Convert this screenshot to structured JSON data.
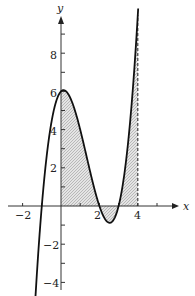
{
  "chart_data": {
    "type": "line",
    "title": "",
    "function": "f(x) = (x+1)(x-2)(x-3)",
    "xlabel": "x",
    "ylabel": "y",
    "xlim": [
      -2.8,
      5.5
    ],
    "ylim": [
      -4.3,
      10.5
    ],
    "x_ticks": [
      -2,
      -1,
      1,
      2,
      3,
      4,
      5
    ],
    "x_tick_labels": [
      "-2",
      "2",
      "4"
    ],
    "y_ticks": [
      -4,
      -3,
      -2,
      -1,
      1,
      2,
      3,
      4,
      5,
      6,
      7,
      8,
      9
    ],
    "y_tick_labels": [
      "-4",
      "-2",
      "2",
      "4",
      "6",
      "8"
    ],
    "grid": false,
    "series": [
      {
        "name": "curve",
        "x": [
          -1.3,
          -1,
          0,
          0.5,
          1,
          2,
          2.5,
          3,
          3.5,
          4
        ],
        "y": [
          -4.14,
          0,
          6,
          5.63,
          4,
          0,
          -0.88,
          0,
          1.88,
          10
        ]
      }
    ],
    "shaded_region": {
      "x_from": 0,
      "x_to": 4,
      "between": "curve and x-axis"
    },
    "annotations": [
      {
        "type": "dashed-vertical-line",
        "x": 4,
        "y_from": 0,
        "y_to": 10
      }
    ],
    "labels": {
      "x_axis": "x",
      "y_axis": "y",
      "xt_neg2": "−2",
      "xt_2": "2",
      "xt_4": "4",
      "yt_8": "8",
      "yt_6": "6",
      "yt_4": "4",
      "yt_2": "2",
      "yt_neg2": "−2",
      "yt_neg4": "−4"
    }
  }
}
